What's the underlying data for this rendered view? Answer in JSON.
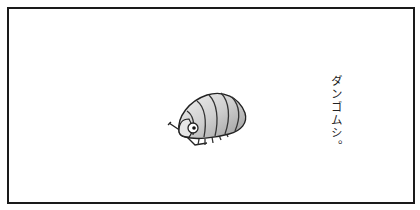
{
  "panel": {
    "caption": "ダンゴムシ。",
    "illustration": "pill-bug",
    "border_color": "#1a1a1a",
    "background": "#ffffff"
  }
}
